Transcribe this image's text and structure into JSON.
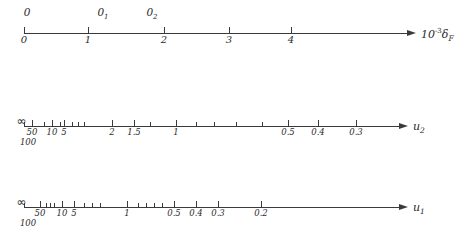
{
  "figure": {
    "type": "nomogram",
    "axes": [
      {
        "id": "axis-delta-f",
        "name": "axis-delta-f",
        "label_html": "10<sup>-3</sup>&delta;<sub>F</sub>",
        "label_text": "10^-3 δ_F",
        "y": 33,
        "x_start": 24,
        "x_end": 408,
        "scale": "linear",
        "ticks_below": [
          {
            "x": 24,
            "label": "0",
            "major": true
          },
          {
            "x": 88,
            "label": "1",
            "major": true
          },
          {
            "x": 164,
            "label": "2",
            "major": true
          },
          {
            "x": 229,
            "label": "3",
            "major": true
          },
          {
            "x": 291,
            "label": "4",
            "major": true
          }
        ],
        "ticks_above": [
          {
            "x": 24,
            "label": "0"
          },
          {
            "x": 101,
            "label": "0₁"
          },
          {
            "x": 150,
            "label": "0₂"
          }
        ],
        "annotations_above": [
          {
            "x": 27,
            "text": "0",
            "sub": ""
          },
          {
            "x": 103,
            "text": "0",
            "sub": "1"
          },
          {
            "x": 152,
            "text": "0",
            "sub": "2"
          }
        ]
      },
      {
        "id": "axis-u2",
        "name": "axis-u2",
        "label_html": "u<sub>2</sub>",
        "label_text": "u_2",
        "y": 126,
        "x_start": 24,
        "x_end": 400,
        "scale": "reciprocal",
        "infinity_marker": {
          "x": 21,
          "symbol": "∞"
        },
        "ticks_below": [
          {
            "x": 24,
            "label": "",
            "major": false
          },
          {
            "x": 28,
            "label": "100",
            "major": false,
            "second_row": true
          },
          {
            "x": 32,
            "label": "50",
            "major": true
          },
          {
            "x": 44,
            "label": "",
            "major": false
          },
          {
            "x": 52,
            "label": "10",
            "major": true
          },
          {
            "x": 60,
            "label": "",
            "major": false
          },
          {
            "x": 64,
            "label": "5",
            "major": true
          },
          {
            "x": 72,
            "label": "",
            "major": false
          },
          {
            "x": 78,
            "label": "",
            "major": false
          },
          {
            "x": 84,
            "label": "",
            "major": false
          },
          {
            "x": 112,
            "label": "2",
            "major": true
          },
          {
            "x": 134,
            "label": "1.5",
            "major": true
          },
          {
            "x": 150,
            "label": "",
            "major": false
          },
          {
            "x": 176,
            "label": "1",
            "major": true
          },
          {
            "x": 196,
            "label": "",
            "major": false
          },
          {
            "x": 214,
            "label": "",
            "major": false
          },
          {
            "x": 236,
            "label": "",
            "major": false
          },
          {
            "x": 262,
            "label": "",
            "major": false
          },
          {
            "x": 288,
            "label": "0.5",
            "major": true
          },
          {
            "x": 318,
            "label": "0.4",
            "major": true
          },
          {
            "x": 356,
            "label": "0.3",
            "major": true
          }
        ]
      },
      {
        "id": "axis-u1",
        "name": "axis-u1",
        "label_html": "u<sub>1</sub>",
        "label_text": "u_1",
        "y": 207,
        "x_start": 24,
        "x_end": 400,
        "scale": "reciprocal",
        "infinity_marker": {
          "x": 21,
          "symbol": "∞"
        },
        "ticks_below": [
          {
            "x": 24,
            "label": "",
            "major": false
          },
          {
            "x": 28,
            "label": "100",
            "major": false,
            "second_row": true
          },
          {
            "x": 40,
            "label": "50",
            "major": true
          },
          {
            "x": 46,
            "label": "",
            "major": false
          },
          {
            "x": 50,
            "label": "",
            "major": false
          },
          {
            "x": 54,
            "label": "",
            "major": false
          },
          {
            "x": 62,
            "label": "10",
            "major": true
          },
          {
            "x": 74,
            "label": "5",
            "major": true
          },
          {
            "x": 84,
            "label": "",
            "major": false
          },
          {
            "x": 92,
            "label": "",
            "major": false
          },
          {
            "x": 100,
            "label": "",
            "major": false
          },
          {
            "x": 127,
            "label": "1",
            "major": true
          },
          {
            "x": 138,
            "label": "",
            "major": false
          },
          {
            "x": 146,
            "label": "",
            "major": false
          },
          {
            "x": 154,
            "label": "",
            "major": false
          },
          {
            "x": 162,
            "label": "",
            "major": false
          },
          {
            "x": 174,
            "label": "0.5",
            "major": true
          },
          {
            "x": 196,
            "label": "0.4",
            "major": true
          },
          {
            "x": 218,
            "label": "0.3",
            "major": true
          },
          {
            "x": 261,
            "label": "0.2",
            "major": true
          }
        ]
      }
    ]
  }
}
